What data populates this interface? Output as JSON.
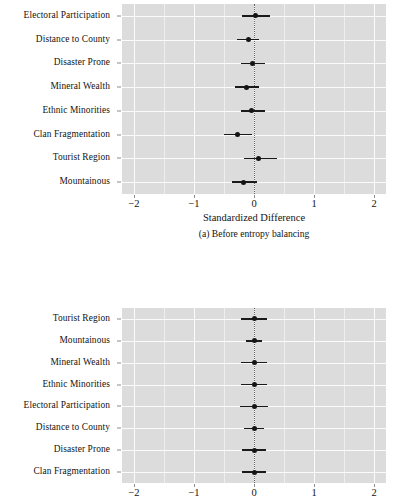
{
  "figure": {
    "background": "#ffffff",
    "panel_fill": "#dcdcdc",
    "gridline_color": "#fbfbfb",
    "point_color": "#141414",
    "zero_line_color": "#4a4a4a"
  },
  "panel_a": {
    "caption": "(a) Before entropy balancing",
    "xlabel": "Standardized Difference",
    "xticks": [
      "−2",
      "−1",
      "0",
      "1",
      "2"
    ],
    "xtick_values": [
      -2,
      -1,
      0,
      1,
      2
    ],
    "rows": [
      "Electoral Participation",
      "Distance to County",
      "Disaster Prone",
      "Mineral Wealth",
      "Ethnic Minorities",
      "Clan Fragmentation",
      "Tourist Region",
      "Mountainous"
    ]
  },
  "panel_b": {
    "caption": "",
    "xlabel": "",
    "xticks": [
      "−2",
      "−1",
      "0",
      "1",
      "2"
    ],
    "xtick_values": [
      -2,
      -1,
      0,
      1,
      2
    ],
    "rows": [
      "Tourist Region",
      "Mountainous",
      "Mineral Wealth",
      "Ethnic Minorities",
      "Electoral Participation",
      "Distance to County",
      "Disaster Prone",
      "Clan Fragmentation"
    ]
  },
  "chart_data": [
    {
      "type": "scatter",
      "title": "(a) Before entropy balancing",
      "subtitle": "",
      "xlabel": "Standardized Difference",
      "ylabel": "",
      "xlim": [
        -2.2,
        2.2
      ],
      "xticks": [
        -2,
        -1,
        0,
        1,
        2
      ],
      "xticklabels": [
        "−2",
        "−1",
        "0",
        "1",
        "2"
      ],
      "grid": true,
      "legend": "none",
      "reference_line_x": 0,
      "orientation": "horizontal-pointrange",
      "categories": [
        "Electoral Participation",
        "Distance to County",
        "Disaster Prone",
        "Mineral Wealth",
        "Ethnic Minorities",
        "Clan Fragmentation",
        "Tourist Region",
        "Mountainous"
      ],
      "values": [
        0.02,
        -0.1,
        -0.03,
        -0.12,
        -0.04,
        -0.28,
        0.08,
        -0.17
      ],
      "ci_low": [
        -0.2,
        -0.28,
        -0.22,
        -0.31,
        -0.22,
        -0.5,
        -0.17,
        -0.37
      ],
      "ci_high": [
        0.27,
        0.08,
        0.18,
        0.08,
        0.18,
        -0.03,
        0.38,
        0.05
      ]
    },
    {
      "type": "scatter",
      "title": "",
      "subtitle": "",
      "xlabel": "",
      "ylabel": "",
      "xlim": [
        -2.2,
        2.2
      ],
      "xticks": [
        -2,
        -1,
        0,
        1,
        2
      ],
      "xticklabels": [
        "−2",
        "−1",
        "0",
        "1",
        "2"
      ],
      "grid": true,
      "legend": "none",
      "reference_line_x": 0,
      "orientation": "horizontal-pointrange",
      "categories": [
        "Tourist Region",
        "Mountainous",
        "Mineral Wealth",
        "Ethnic Minorities",
        "Electoral Participation",
        "Distance to County",
        "Disaster Prone",
        "Clan Fragmentation"
      ],
      "values": [
        0.0,
        0.0,
        0.0,
        0.0,
        0.0,
        0.0,
        0.0,
        0.0
      ],
      "ci_low": [
        -0.22,
        -0.13,
        -0.21,
        -0.22,
        -0.23,
        -0.16,
        -0.2,
        -0.2
      ],
      "ci_high": [
        0.22,
        0.13,
        0.21,
        0.22,
        0.23,
        0.16,
        0.2,
        0.2
      ]
    }
  ]
}
